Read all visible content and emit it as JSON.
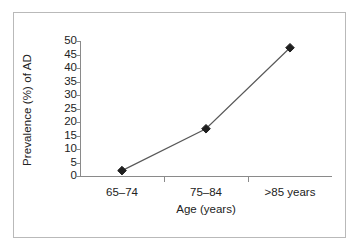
{
  "chart_data": {
    "type": "line",
    "title": "",
    "subtitle": "",
    "xlabel": "Age (years)",
    "ylabel": "Prevalence (%) of AD",
    "categories": [
      "65–74",
      "75–84",
      ">85 years"
    ],
    "values": [
      2,
      17.5,
      47.5
    ],
    "series": [
      {
        "name": "Prevalence of AD",
        "values": [
          2,
          17.5,
          47.5
        ]
      }
    ],
    "ylim": [
      0,
      50
    ],
    "yticks": [
      0,
      5,
      10,
      15,
      20,
      25,
      30,
      35,
      40,
      45,
      50
    ],
    "ytick_labels": [
      "0",
      "5",
      "10",
      "15",
      "20",
      "25",
      "30",
      "35",
      "40",
      "45",
      "50"
    ],
    "grid": false,
    "legend": false,
    "legend_position": "none",
    "marker": "diamond",
    "marker_color": "#1f1f1f",
    "line_color": "#595959",
    "axis_color": "#8a8a8a",
    "frame_color": "#b9b9b9",
    "background": "#ffffff"
  }
}
